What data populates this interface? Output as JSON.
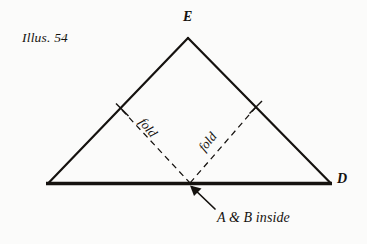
{
  "figure": {
    "caption": "Illus. 54",
    "vertices": {
      "apex_label": "E",
      "right_label": "D"
    },
    "fold_label_left": "fold",
    "fold_label_right": "fold",
    "annotation": "A & B inside",
    "colors": {
      "background": "#fbfbfa",
      "ink": "#15120f"
    }
  }
}
